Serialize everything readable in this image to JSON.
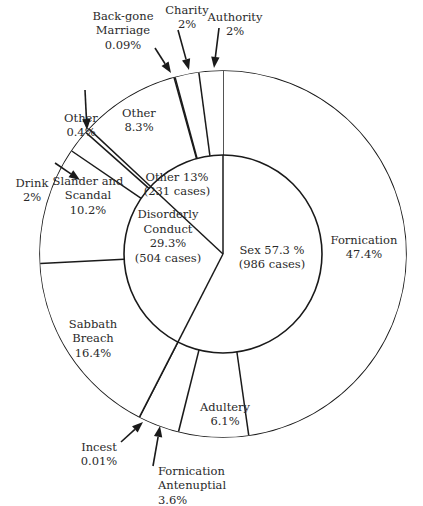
{
  "chart_data": {
    "type": "pie",
    "subtype": "nested-donut",
    "title": "",
    "inner": [
      {
        "name": "Sex",
        "label_lines": [
          "Sex 57.3 %",
          "(986 cases)"
        ],
        "value": 57.3,
        "cases": 986
      },
      {
        "name": "Disorderly Conduct",
        "label_lines": [
          "Disorderly",
          "Conduct",
          "29.3%",
          "(504 cases)"
        ],
        "value": 29.3,
        "cases": 504
      },
      {
        "name": "Other",
        "label_lines": [
          "Other 13%",
          "(231 cases)"
        ],
        "value": 13.0,
        "cases": 231
      }
    ],
    "outer": [
      {
        "name": "Fornication",
        "parent": "Sex",
        "value": 47.4,
        "label_lines": [
          "Fornication",
          "47.4%"
        ],
        "callout": false
      },
      {
        "name": "Adultery",
        "parent": "Sex",
        "value": 6.1,
        "label_lines": [
          "Adultery",
          "6.1%"
        ],
        "callout": false
      },
      {
        "name": "Fornication Antenuptial",
        "parent": "Sex",
        "value": 3.6,
        "label_lines": [
          "Fornication",
          "Antenuptial",
          "3.6%"
        ],
        "callout": true
      },
      {
        "name": "Incest",
        "parent": "Disorderly Conduct",
        "value": 0.01,
        "label_lines": [
          "Incest",
          "0.01%"
        ],
        "callout": true
      },
      {
        "name": "Sabbath Breach",
        "parent": "Disorderly Conduct",
        "value": 16.4,
        "label_lines": [
          "Sabbath",
          "Breach",
          "16.4%"
        ],
        "callout": false
      },
      {
        "name": "Slander and Scandal",
        "parent": "Disorderly Conduct",
        "value": 10.2,
        "label_lines": [
          "Slander and",
          "Scandal",
          "10.2%"
        ],
        "callout": false
      },
      {
        "name": "Drink",
        "parent": "Disorderly Conduct",
        "value": 2.0,
        "label_lines": [
          "Drink",
          "2%"
        ],
        "callout": true
      },
      {
        "name": "Other",
        "parent": "Disorderly Conduct",
        "value": 0.4,
        "label_lines": [
          "Other",
          "0.4%"
        ],
        "callout": true
      },
      {
        "name": "Other",
        "parent": "Other",
        "value": 8.3,
        "label_lines": [
          "Other",
          "8.3%"
        ],
        "callout": false
      },
      {
        "name": "Back-gone Marriage",
        "parent": "Other",
        "value": 0.09,
        "label_lines": [
          "Back-gone",
          "Marriage",
          "0.09%"
        ],
        "callout": true
      },
      {
        "name": "Charity",
        "parent": "Other",
        "value": 2.0,
        "label_lines": [
          "Charity",
          "2%"
        ],
        "callout": true
      },
      {
        "name": "Authority",
        "parent": "Other",
        "value": 2.0,
        "label_lines": [
          "Authority",
          "2%"
        ],
        "callout": true
      }
    ],
    "start": "12 o'clock",
    "direction": "clockwise",
    "legend": "none"
  }
}
